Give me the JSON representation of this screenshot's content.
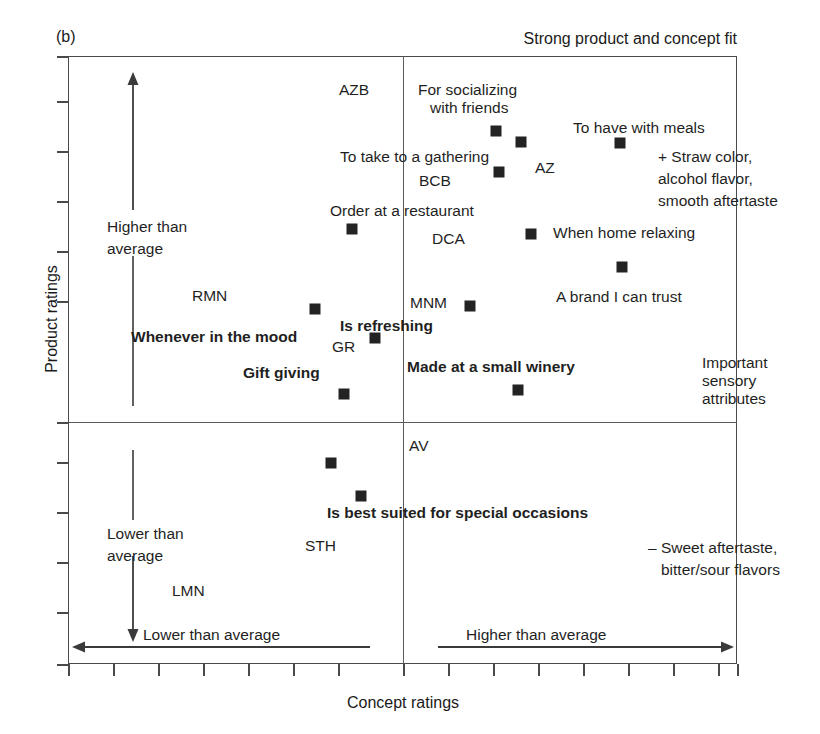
{
  "figure": {
    "panel_letter": "(b)",
    "top_title": "Strong product and concept fit",
    "ylabel": "Product ratings",
    "xlabel": "Concept ratings"
  },
  "axis_annotations": {
    "y_high": "Higher than\naverage",
    "y_low": "Lower than\naverage",
    "x_low": "Lower than average",
    "x_high": "Higher than average"
  },
  "side_notes": {
    "positive_sensory": "+ Straw color,\nalcohol flavor,\nsmooth aftertaste",
    "important_sensory": "Important\nsensory\nattributes",
    "negative_sensory": "– Sweet aftertaste,\nbitter/sour flavors"
  },
  "chart_data": {
    "type": "scatter",
    "title": "Strong product and concept fit",
    "xlabel": "Concept ratings",
    "ylabel": "Product ratings",
    "grid": false,
    "legend": null,
    "axis_origin_label": "quadrant cross at average concept rating and average product rating",
    "xlim": [
      0,
      100
    ],
    "ylim": [
      0,
      100
    ],
    "quadrant_center": [
      50,
      40
    ],
    "points": [
      {
        "label": "For socializing with friends",
        "bold": false,
        "x": 44.0,
        "y": 82.0
      },
      {
        "label": "AZ",
        "bold": false,
        "x": 48.5,
        "y": 79.0
      },
      {
        "label": "BCB",
        "bold": false,
        "x": 44.5,
        "y": 73.0
      },
      {
        "label": "To have with meals",
        "bold": false,
        "x": 67.5,
        "y": 80.5
      },
      {
        "label": "Order at a restaurant",
        "bold": false,
        "x": 32.5,
        "y": 65.5
      },
      {
        "label": "When home relaxing",
        "bold": false,
        "x": 58.5,
        "y": 65.5
      },
      {
        "label": "A brand I can trust",
        "bold": false,
        "x": 70.0,
        "y": 58.0
      },
      {
        "label": "Whenever in the mood",
        "bold": true,
        "x": 30.0,
        "y": 51.5
      },
      {
        "label": "Is refreshing",
        "bold": true,
        "x": 33.0,
        "y": 46.5
      },
      {
        "label": "MNM",
        "bold": false,
        "x": 53.0,
        "y": 50.5
      },
      {
        "label": "Gift giving",
        "bold": true,
        "x": 32.5,
        "y": 39.0
      },
      {
        "label": "Made at a small winery",
        "bold": true,
        "x": 62.5,
        "y": 39.5
      },
      {
        "label": "STH",
        "bold": false,
        "x": 31.0,
        "y": 27.5
      },
      {
        "label": "Is best suited for special occasions",
        "bold": true,
        "x": 35.5,
        "y": 23.0
      }
    ],
    "unplotted_codes": [
      "AZB",
      "RMN",
      "DCA",
      "GR",
      "AV",
      "LMN",
      "STH"
    ],
    "point_labels": [
      "AZB",
      "For socializing with friends",
      "To have with meals",
      "To take to a gathering",
      "AZ",
      "BCB",
      "Order at a restaurant",
      "DCA",
      "When home relaxing",
      "RMN",
      "MNM",
      "A brand I can trust",
      "Whenever in the mood",
      "Is refreshing",
      "GR",
      "Gift giving",
      "Made at a small winery",
      "AV",
      "Is best suited for special occasions",
      "STH",
      "LMN"
    ]
  },
  "plot_labels": [
    {
      "name": "azb",
      "text": "AZB",
      "x": 339,
      "y": 81,
      "bold": false,
      "align": "left"
    },
    {
      "name": "for-socializing",
      "text": "For socializing",
      "x": 418,
      "y": 81,
      "bold": false,
      "align": "left"
    },
    {
      "name": "with-friends",
      "text": "with friends",
      "x": 430,
      "y": 99,
      "bold": false,
      "align": "left"
    },
    {
      "name": "to-have-meals",
      "text": "To have with meals",
      "x": 573,
      "y": 119,
      "bold": false,
      "align": "left"
    },
    {
      "name": "to-take",
      "text": "To take to a gathering",
      "x": 340,
      "y": 148,
      "bold": false,
      "align": "left"
    },
    {
      "name": "az",
      "text": "AZ",
      "x": 535,
      "y": 159,
      "bold": false,
      "align": "left"
    },
    {
      "name": "bcb",
      "text": "BCB",
      "x": 419,
      "y": 172,
      "bold": false,
      "align": "left"
    },
    {
      "name": "straw-color",
      "text": "+ Straw color,",
      "x": 658,
      "y": 148,
      "bold": false,
      "align": "left"
    },
    {
      "name": "alcohol-flavor",
      "text": "alcohol flavor,",
      "x": 658,
      "y": 170,
      "bold": false,
      "align": "left"
    },
    {
      "name": "smooth-after",
      "text": "smooth aftertaste",
      "x": 658,
      "y": 192,
      "bold": false,
      "align": "left"
    },
    {
      "name": "order-rest",
      "text": "Order at a restaurant",
      "x": 330,
      "y": 202,
      "bold": false,
      "align": "left"
    },
    {
      "name": "dca",
      "text": "DCA",
      "x": 432,
      "y": 230,
      "bold": false,
      "align": "left"
    },
    {
      "name": "when-home",
      "text": "When home relaxing",
      "x": 553,
      "y": 224,
      "bold": false,
      "align": "left"
    },
    {
      "name": "a-brand",
      "text": "A brand I can trust",
      "x": 556,
      "y": 288,
      "bold": false,
      "align": "left"
    },
    {
      "name": "rmn",
      "text": "RMN",
      "x": 192,
      "y": 287,
      "bold": false,
      "align": "left"
    },
    {
      "name": "mnm",
      "text": "MNM",
      "x": 410,
      "y": 294,
      "bold": false,
      "align": "left"
    },
    {
      "name": "is-refreshing",
      "text": "Is refreshing",
      "x": 340,
      "y": 317,
      "bold": true,
      "align": "left"
    },
    {
      "name": "whenever-mood",
      "text": "Whenever in the mood",
      "x": 131,
      "y": 328,
      "bold": true,
      "align": "left"
    },
    {
      "name": "gr",
      "text": "GR",
      "x": 332,
      "y": 338,
      "bold": false,
      "align": "left"
    },
    {
      "name": "made-winery",
      "text": "Made at a small winery",
      "x": 407,
      "y": 358,
      "bold": true,
      "align": "left"
    },
    {
      "name": "gift-giving",
      "text": "Gift giving",
      "x": 243,
      "y": 364,
      "bold": true,
      "align": "left"
    },
    {
      "name": "important",
      "text": "Important",
      "x": 702,
      "y": 354,
      "bold": false,
      "align": "left"
    },
    {
      "name": "sensory",
      "text": "sensory",
      "x": 702,
      "y": 372,
      "bold": false,
      "align": "left"
    },
    {
      "name": "attributes",
      "text": "attributes",
      "x": 702,
      "y": 390,
      "bold": false,
      "align": "left"
    },
    {
      "name": "av",
      "text": "AV",
      "x": 409,
      "y": 437,
      "bold": false,
      "align": "left"
    },
    {
      "name": "is-best-suited",
      "text": "Is best suited for special occasions",
      "x": 327,
      "y": 504,
      "bold": true,
      "align": "left"
    },
    {
      "name": "sth",
      "text": "STH",
      "x": 305,
      "y": 537,
      "bold": false,
      "align": "left"
    },
    {
      "name": "lmn",
      "text": "LMN",
      "x": 172,
      "y": 582,
      "bold": false,
      "align": "left"
    },
    {
      "name": "sweet-after",
      "text": "– Sweet aftertaste,",
      "x": 648,
      "y": 539,
      "bold": false,
      "align": "left"
    },
    {
      "name": "bitter-sour",
      "text": "bitter/sour flavors",
      "x": 661,
      "y": 561,
      "bold": false,
      "align": "left"
    },
    {
      "name": "higher-avg-y1",
      "text": "Higher than",
      "x": 107,
      "y": 218,
      "bold": false,
      "align": "left"
    },
    {
      "name": "higher-avg-y2",
      "text": "average",
      "x": 107,
      "y": 240,
      "bold": false,
      "align": "left"
    },
    {
      "name": "lower-avg-y1",
      "text": "Lower than",
      "x": 107,
      "y": 525,
      "bold": false,
      "align": "left"
    },
    {
      "name": "lower-avg-y2",
      "text": "average",
      "x": 107,
      "y": 547,
      "bold": false,
      "align": "left"
    },
    {
      "name": "lower-avg-x",
      "text": "Lower than average",
      "x": 143,
      "y": 626,
      "bold": false,
      "align": "left"
    },
    {
      "name": "higher-avg-x",
      "text": "Higher than average",
      "x": 466,
      "y": 626,
      "bold": false,
      "align": "left"
    }
  ],
  "markers": [
    {
      "name": "marker-for-socializing",
      "x": 496,
      "y": 131
    },
    {
      "name": "marker-az",
      "x": 521,
      "y": 142
    },
    {
      "name": "marker-bcb",
      "x": 499,
      "y": 172
    },
    {
      "name": "marker-to-have-meals",
      "x": 620,
      "y": 143
    },
    {
      "name": "marker-order-restaurant",
      "x": 352,
      "y": 229
    },
    {
      "name": "marker-when-home",
      "x": 531,
      "y": 234
    },
    {
      "name": "marker-a-brand",
      "x": 622,
      "y": 267
    },
    {
      "name": "marker-whenever-mood",
      "x": 315,
      "y": 309
    },
    {
      "name": "marker-mnm",
      "x": 470,
      "y": 306
    },
    {
      "name": "marker-is-refreshing",
      "x": 375,
      "y": 338
    },
    {
      "name": "marker-gift-giving",
      "x": 344,
      "y": 394
    },
    {
      "name": "marker-made-winery",
      "x": 518,
      "y": 390
    },
    {
      "name": "marker-sth",
      "x": 331,
      "y": 463
    },
    {
      "name": "marker-is-best-suited",
      "x": 361,
      "y": 496
    }
  ],
  "y_ticks": [
    56,
    101,
    151,
    201,
    251,
    301,
    422,
    462,
    512,
    562,
    612,
    664
  ],
  "x_ticks": [
    68,
    113,
    158,
    203,
    248,
    293,
    338,
    403,
    448,
    493,
    538,
    583,
    628,
    673,
    718,
    737
  ]
}
